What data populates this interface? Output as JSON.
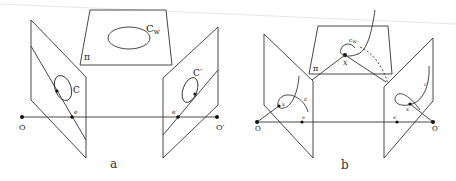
{
  "figure": {
    "panels": [
      {
        "id": "a",
        "caption": "a",
        "labels": {
          "plane": "π",
          "world_conic": "C",
          "world_conic_sub": "w",
          "left_conic": "C",
          "right_conic": "C′",
          "left_epipole": "e",
          "right_epipole": "e′",
          "left_center": "O",
          "right_center": "O′"
        }
      },
      {
        "id": "b",
        "caption": "b",
        "labels": {
          "plane": "π",
          "world_curve": "c",
          "world_curve_sub": "w",
          "world_point": "X",
          "left_curve": "c",
          "right_curve": "c′",
          "left_point": "x",
          "right_point": "x′",
          "left_epipole": "e",
          "right_epipole": "e′",
          "left_center": "O",
          "right_center": "O′"
        }
      }
    ],
    "colors": {
      "line": "#333333",
      "point": "#111111",
      "background": "#ffffff"
    }
  }
}
